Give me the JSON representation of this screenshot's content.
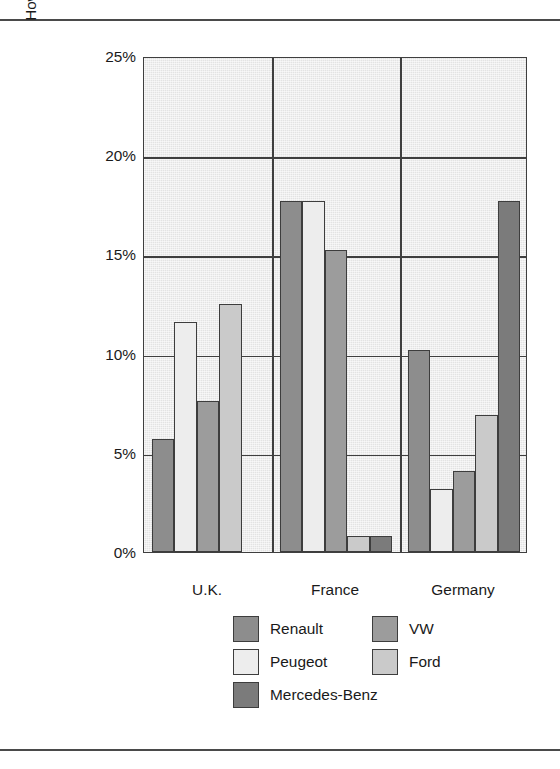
{
  "figure": {
    "axis_title_lines": [
      "How European Consumers Rank Their",
      "Favorite Car Commercials"
    ]
  },
  "chart_data": {
    "type": "bar",
    "title": "",
    "xlabel": "",
    "ylabel": "How European Consumers Rank Their Favorite Car Commercials",
    "categories": [
      "U.K.",
      "France",
      "Germany"
    ],
    "ylim": [
      0,
      25
    ],
    "ytick_labels": [
      "0%",
      "5%",
      "10%",
      "15%",
      "20%",
      "25%"
    ],
    "ytick_values": [
      0,
      5,
      10,
      15,
      20,
      25
    ],
    "grid": true,
    "legend_position": "bottom",
    "value_unit": "%",
    "series": [
      {
        "name": "Renault",
        "color": "#8d8d8d",
        "values": [
          5.7,
          17.7,
          10.2
        ]
      },
      {
        "name": "Peugeot",
        "color": "#ededed",
        "values": [
          11.6,
          17.7,
          3.2
        ]
      },
      {
        "name": "VW",
        "color": "#9c9c9c",
        "values": [
          7.6,
          15.2,
          4.1
        ]
      },
      {
        "name": "Ford",
        "color": "#cacaca",
        "values": [
          12.5,
          0.8,
          6.9
        ]
      },
      {
        "name": "Mercedes-Benz",
        "color": "#7b7b7b",
        "values": [
          0,
          0.8,
          17.7
        ]
      }
    ]
  },
  "legend": {
    "entries": [
      {
        "label": "Renault",
        "color": "#8d8d8d"
      },
      {
        "label": "VW",
        "color": "#9c9c9c"
      },
      {
        "label": "Peugeot",
        "color": "#ededed"
      },
      {
        "label": "Ford",
        "color": "#cacaca"
      },
      {
        "label": "Mercedes-Benz",
        "color": "#7b7b7b"
      }
    ]
  }
}
